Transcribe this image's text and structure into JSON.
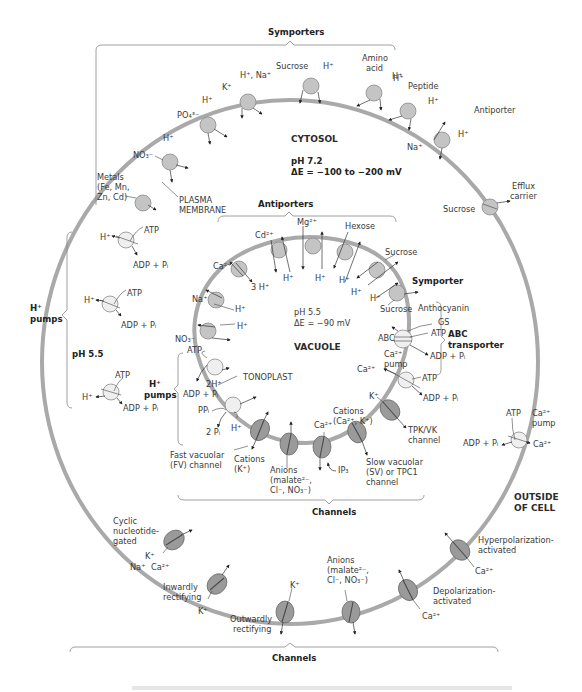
{
  "regions": {
    "cytosol": "CYTOSOL",
    "cytosol_ph": "pH 7.2",
    "cytosol_de": "ΔE = −100 to −200 mV",
    "vacuole": "VACUOLE",
    "vacuole_ph": "pH 5.5",
    "vacuole_de": "ΔE = −90 mV",
    "outside": [
      "OUTSIDE",
      "OF CELL"
    ],
    "apoplast_ph": "pH 5.5"
  },
  "membranes": {
    "plasma": [
      "PLASMA",
      "MEMBRANE"
    ],
    "tonoplast": "TONOPLAST"
  },
  "groups": {
    "symporters": "Symporters",
    "antiporter": "Antiporter",
    "pm_h_pumps": [
      "H⁺",
      "pumps"
    ],
    "pm_channels": "Channels",
    "vac_antiporters": "Antiporters",
    "vac_symporter": "Symporter",
    "vac_abc": [
      "ABC",
      "transporter"
    ],
    "vac_h_pumps": [
      "H⁺",
      "pumps"
    ],
    "vac_channels": "Channels"
  },
  "plasma_membrane_transporters": {
    "metals": [
      "Metals",
      "(Fe, Mn,",
      "Zn, Cd)"
    ],
    "nitrate": "NO₃⁻",
    "nitrate_h": "H⁺",
    "phosphate": "PO₄³⁻",
    "phosphate_h": "H⁺",
    "k": "K⁺",
    "h_na": "H⁺, Na⁺",
    "sucrose": "Sucrose",
    "sucrose_h": "H⁺",
    "amino_acid": [
      "Amino",
      "acid"
    ],
    "amino_h": "H⁺",
    "peptide": "Peptide",
    "peptide_h": "H⁺",
    "antiporter_na": "Na⁺",
    "antiporter_h": "H⁺",
    "efflux": [
      "Efflux",
      "carrier"
    ],
    "efflux_sucrose": "Sucrose"
  },
  "plasma_membrane_pumps": {
    "atp": "ATP",
    "adp": "ADP + Pᵢ",
    "h": "H⁺",
    "ca_pump": [
      "Ca²⁺",
      "pump"
    ],
    "ca": "Ca²⁺"
  },
  "plasma_membrane_channels": {
    "cng": [
      "Cyclic",
      "nucleotide-",
      "gated"
    ],
    "cng_ions": [
      "K⁺",
      "Na⁺",
      "Ca²⁺"
    ],
    "inward": [
      "Inwardly",
      "rectifying"
    ],
    "inward_k": "K⁺",
    "outward": [
      "Outwardly",
      "rectifying"
    ],
    "outward_k": "K⁺",
    "anions": [
      "Anions",
      "(malate²⁻,",
      "Cl⁻, NO₃⁻)"
    ],
    "depol": [
      "Depolarization-",
      "activated"
    ],
    "depol_ca": "Ca²⁺",
    "hyperpol": [
      "Hyperpolarization-",
      "activated"
    ],
    "hyperpol_ca": "Ca²⁺"
  },
  "vacuole_transporters": {
    "nitrate": "NO₃⁻",
    "nitrate_h": "H⁺",
    "na": "Na⁺",
    "na_h": "H⁺",
    "ca": "Ca²⁺",
    "ca_h": "3 H⁺",
    "cd": "Cd²⁺",
    "cd_h": "H⁺",
    "mg": "Mg²⁺",
    "mg_h": "H⁺",
    "hexose": "Hexose",
    "hexose_h": "H⁺",
    "sucrose": "Sucrose",
    "sucrose_h": "H⁺",
    "sym_h": "H⁺",
    "sym_sucrose": "Sucrose",
    "anthocyanin": "Anthocyanin",
    "gs": "GS",
    "abc": "ABC",
    "abc_atp": "ATP",
    "abc_adp": "ADP + Pᵢ",
    "ca_pump": [
      "Ca²⁺",
      "pump"
    ],
    "ca_pump_ion": "Ca²⁺",
    "ca_pump_atp": "ATP",
    "ca_pump_adp": "ADP + Pᵢ",
    "vatp_atp": "ATP",
    "vatp_adp": "ADP + Pᵢ",
    "vatp_h": "2H⁺",
    "ppase_ppi": "PPᵢ",
    "ppase_pi": "2 Pᵢ",
    "ppase_h": "H⁺"
  },
  "vacuole_channels": {
    "fv": [
      "Fast vacuolar",
      "(FV) channel"
    ],
    "fv_ions": [
      "Cations",
      "(K⁺)"
    ],
    "anions": [
      "Anions",
      "(malate²⁻,",
      "Cl⁻, NO₃⁻)"
    ],
    "ca": "Ca²⁺",
    "ip3": "IP₃",
    "sv_ions": [
      "Cations",
      "(Ca²⁺, K⁺)"
    ],
    "sv": [
      "Slow vacuolar",
      "(SV) or TPC1",
      "channel"
    ],
    "tpk_k": "K⁺",
    "tpk": [
      "TPK/VK",
      "channel"
    ]
  },
  "colors": {
    "membrane": "#a9a9a9",
    "carrier": "#c4c4c4",
    "pump": "#efefef",
    "channel": "#9a9a9a",
    "text": "#3a3a3a"
  }
}
